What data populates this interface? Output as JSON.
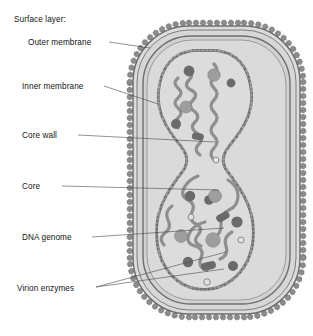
{
  "figure": {
    "type": "biological-diagram",
    "labels": [
      {
        "id": "surface-layer",
        "text": "Surface layer:",
        "x": 14,
        "y": 22,
        "leader": false
      },
      {
        "id": "outer-membrane",
        "text": "Outer membrane",
        "x": 28,
        "y": 45,
        "leader": true
      },
      {
        "id": "inner-membrane",
        "text": "Inner membrane",
        "x": 22,
        "y": 89,
        "leader": true
      },
      {
        "id": "core-wall",
        "text": "Core wall",
        "x": 22,
        "y": 138,
        "leader": true
      },
      {
        "id": "core",
        "text": "Core",
        "x": 22,
        "y": 189,
        "leader": true
      },
      {
        "id": "dna-genome",
        "text": "DNA genome",
        "x": 22,
        "y": 240,
        "leader": true
      },
      {
        "id": "virion-enzymes",
        "text": "Virion enzymes",
        "x": 17,
        "y": 289,
        "leader": true
      }
    ],
    "colors": {
      "background": "#ffffff",
      "envelope_fill": "#dcdcdc",
      "envelope_stroke": "#6e6e6e",
      "lumen_fill": "#d2d2d2",
      "core_fill": "#d9d9d9",
      "core_wall": "#8a8a8a",
      "spike": "#8c8c8c",
      "dna_strand": "#8f8f8f",
      "granule_dark": "#6a6a6a",
      "granule_light": "#9e9e9e",
      "leader_line": "#4a4a4a",
      "text": "#141414"
    },
    "structures": [
      {
        "name": "surface-spikes",
        "count": 62,
        "shape": "knobbed-stalk"
      },
      {
        "name": "outer-membrane",
        "shape": "rounded-rectangle-outline"
      },
      {
        "name": "inner-membrane",
        "shape": "rounded-rectangle-outline"
      },
      {
        "name": "core-wall",
        "shape": "hourglass-beaded-band"
      },
      {
        "name": "core",
        "shape": "biconcave-hourglass"
      },
      {
        "name": "dna-genome",
        "shape": "coiled-helical-strand"
      },
      {
        "name": "virion-enzymes",
        "shape": "granules-and-rods",
        "granule_count": 24
      }
    ]
  }
}
